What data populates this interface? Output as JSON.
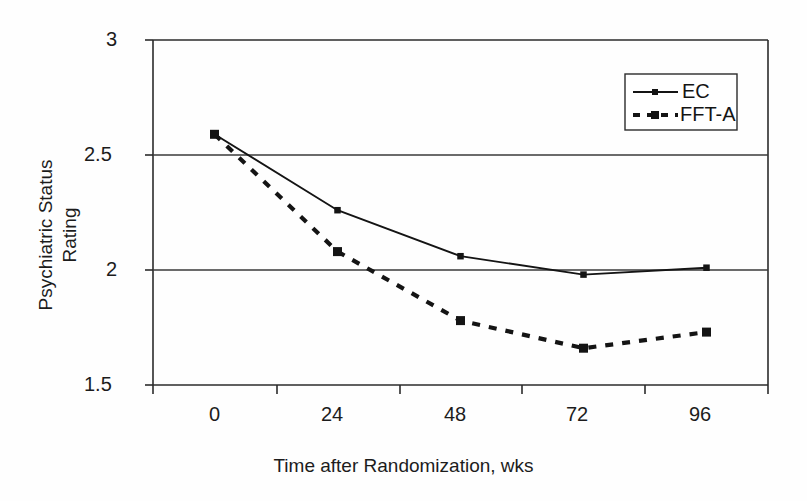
{
  "chart_data": {
    "type": "line",
    "title": "",
    "xlabel": "Time after Randomization, wks",
    "ylabel_line1": "Psychiatric Status",
    "ylabel_line2": "Rating",
    "categories": [
      "0",
      "24",
      "48",
      "72",
      "96"
    ],
    "x": [
      0,
      24,
      48,
      72,
      96
    ],
    "xtick_labels": [
      "0",
      "24",
      "48",
      "72",
      "96"
    ],
    "ytick_labels": [
      "3",
      "2.5",
      "2",
      "1.5"
    ],
    "ytick_values": [
      3,
      2.5,
      2,
      1.5
    ],
    "ylim": [
      1.5,
      3
    ],
    "grid": "horizontal-gridlines-at-2.5-and-2",
    "legend_position": "top-right",
    "series": [
      {
        "name": "EC",
        "style": "solid",
        "marker": "square",
        "color": "#141414",
        "values": [
          2.59,
          2.26,
          2.06,
          1.98,
          2.01
        ]
      },
      {
        "name": "FFT-A",
        "style": "dashed",
        "marker": "square",
        "color": "#141414",
        "values": [
          2.59,
          2.08,
          1.78,
          1.66,
          1.73
        ]
      }
    ]
  },
  "legend": {
    "items": [
      {
        "label": "EC",
        "style": "solid"
      },
      {
        "label": "FFT-A",
        "style": "dashed"
      }
    ]
  },
  "axes": {
    "x_title": "Time after Randomization, wks",
    "y_title_line1": "Psychiatric Status",
    "y_title_line2": "Rating"
  }
}
